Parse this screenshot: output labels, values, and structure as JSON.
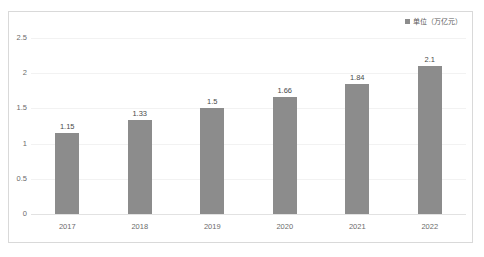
{
  "chart_data": {
    "type": "bar",
    "title": "",
    "subtitle": "",
    "xlabel": "",
    "ylabel": "",
    "categories": [
      "2017",
      "2018",
      "2019",
      "2020",
      "2021",
      "2022"
    ],
    "values": [
      1.15,
      1.33,
      1.5,
      1.66,
      1.84,
      2.1
    ],
    "value_labels": [
      "1.15",
      "1.33",
      "1.5",
      "1.66",
      "1.84",
      "2.1"
    ],
    "ylim": [
      0,
      2.5
    ],
    "ytick_values": [
      2.5,
      2,
      1.5,
      1,
      0.5,
      0
    ],
    "ytick_labels": [
      "2.5",
      "2",
      "1.5",
      "1",
      "0.5",
      "0"
    ],
    "grid": true,
    "legend": {
      "position": "top-right",
      "entries": [
        {
          "label": "单位（万亿元）",
          "color": "#8c8c8c",
          "marker": "square"
        }
      ]
    },
    "series": [
      {
        "name": "单位（万亿元）",
        "color": "#8c8c8c",
        "values": [
          1.15,
          1.33,
          1.5,
          1.66,
          1.84,
          2.1
        ]
      }
    ]
  },
  "colors": {
    "bar": "#8c8c8c",
    "gridline": "#f2f2f2",
    "border": "#d9d9d9",
    "axis_text": "#6b6b6b",
    "value_text": "#4a4a4a",
    "background": "#ffffff"
  }
}
